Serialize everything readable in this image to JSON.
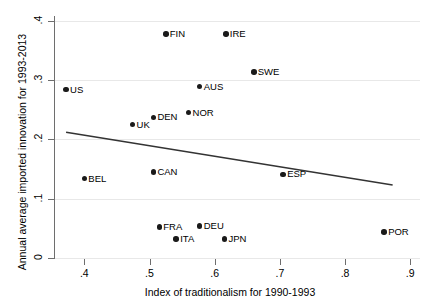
{
  "chart_data": {
    "type": "scatter",
    "title": "",
    "xlabel": "Index of traditionalism for 1990-1993",
    "ylabel": "Annual average imported innovation for 1993-2013",
    "xlim": [
      0.355,
      0.915
    ],
    "ylim": [
      0.0,
      0.408
    ],
    "xticks": [
      ".4",
      ".5",
      ".6",
      ".7",
      ".8",
      ".9"
    ],
    "xtick_values": [
      0.4,
      0.5,
      0.6,
      0.7,
      0.8,
      0.9
    ],
    "yticks": [
      "0",
      ".1",
      ".2",
      ".3",
      ".4"
    ],
    "ytick_values": [
      0,
      0.1,
      0.2,
      0.3,
      0.4
    ],
    "grid": true,
    "grid_axis": "y",
    "legend": "none",
    "marker_color": "#1a1a1a",
    "line_color": "#333333",
    "points": [
      {
        "label": "FIN",
        "x": 0.525,
        "y": 0.378,
        "label_pos": "right"
      },
      {
        "label": "IRE",
        "x": 0.617,
        "y": 0.378,
        "label_pos": "right"
      },
      {
        "label": "SWE",
        "x": 0.66,
        "y": 0.314,
        "label_pos": "right"
      },
      {
        "label": "AUS",
        "x": 0.577,
        "y": 0.289,
        "label_pos": "right"
      },
      {
        "label": "US",
        "x": 0.372,
        "y": 0.284,
        "label_pos": "right"
      },
      {
        "label": "NOR",
        "x": 0.56,
        "y": 0.245,
        "label_pos": "right"
      },
      {
        "label": "DEN",
        "x": 0.506,
        "y": 0.237,
        "label_pos": "right"
      },
      {
        "label": "UK",
        "x": 0.474,
        "y": 0.225,
        "label_pos": "right"
      },
      {
        "label": "CAN",
        "x": 0.506,
        "y": 0.145,
        "label_pos": "right"
      },
      {
        "label": "ESP",
        "x": 0.705,
        "y": 0.141,
        "label_pos": "right"
      },
      {
        "label": "BEL",
        "x": 0.4,
        "y": 0.134,
        "label_pos": "right"
      },
      {
        "label": "FRA",
        "x": 0.515,
        "y": 0.052,
        "label_pos": "right"
      },
      {
        "label": "DEU",
        "x": 0.577,
        "y": 0.054,
        "label_pos": "right"
      },
      {
        "label": "ITA",
        "x": 0.541,
        "y": 0.032,
        "label_pos": "right"
      },
      {
        "label": "JPN",
        "x": 0.615,
        "y": 0.032,
        "label_pos": "right"
      },
      {
        "label": "POR",
        "x": 0.86,
        "y": 0.044,
        "label_pos": "right"
      }
    ],
    "fit_line": {
      "x0": 0.372,
      "y0": 0.212,
      "x1": 0.873,
      "y1": 0.123
    }
  }
}
